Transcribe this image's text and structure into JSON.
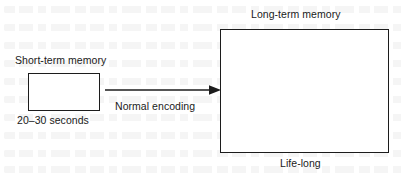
{
  "diagram": {
    "short_term": {
      "label": "Short-term memory",
      "duration": "20–30 seconds",
      "box_name": "short-term-memory-box"
    },
    "long_term": {
      "label": "Long-term memory",
      "duration": "Life-long",
      "box_name": "long-term-memory-box"
    },
    "arrow": {
      "label": "Normal encoding",
      "direction": "left-to-right",
      "icon": "arrow-right-icon"
    },
    "colors": {
      "stroke": "#1c1c1c",
      "text": "#1a1a1a",
      "background": "#ffffff"
    }
  }
}
